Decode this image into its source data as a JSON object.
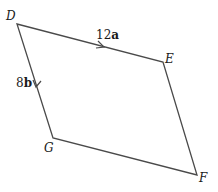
{
  "diagram": {
    "type": "parallelogram",
    "vertices": [
      {
        "name": "D",
        "x": 17,
        "y": 24
      },
      {
        "name": "E",
        "x": 163,
        "y": 62
      },
      {
        "name": "F",
        "x": 197,
        "y": 175
      },
      {
        "name": "G",
        "x": 53,
        "y": 138
      }
    ],
    "labels": {
      "D": "D",
      "E": "E",
      "F": "F",
      "G": "G"
    },
    "edges": {
      "DE": {
        "coef": "12",
        "vec": "a"
      },
      "DG": {
        "coef": "8",
        "vec": "b"
      }
    },
    "line_color": "#4a4a4a"
  }
}
